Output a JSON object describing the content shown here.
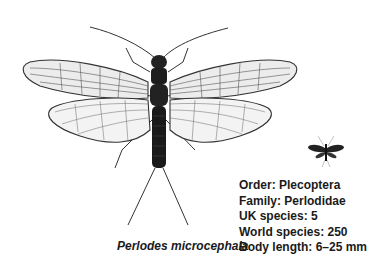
{
  "illustration": {
    "subject": "stonefly",
    "icon": "stonefly-illustration-icon"
  },
  "caption": {
    "species_name": "Perlodes microcephala"
  },
  "facts": [
    {
      "label": "Order",
      "value": "Plecoptera",
      "text": "Order: Plecoptera"
    },
    {
      "label": "Family",
      "value": "Perlodidae",
      "text": "Family: Perlodidae"
    },
    {
      "label": "UK species",
      "value": "5",
      "text": "UK species: 5"
    },
    {
      "label": "World species",
      "value": "250",
      "text": "World species: 250"
    },
    {
      "label": "Body length",
      "value": "6–25 mm",
      "text": "Body length: 6–25 mm"
    }
  ],
  "scale_icon": {
    "name": "actual-size-silhouette-icon",
    "color": "#222222"
  }
}
